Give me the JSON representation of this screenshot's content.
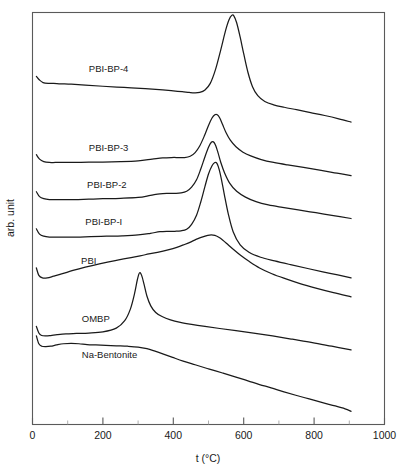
{
  "chart_data": {
    "type": "line",
    "title": "",
    "subtitle": "",
    "xlabel": "t (°C)",
    "ylabel": "arb. unit",
    "xlim": [
      0,
      1000
    ],
    "ylim": [
      0,
      1
    ],
    "grid": false,
    "legend_position": "inline-curve-labels",
    "x_major_ticks": [
      0,
      200,
      400,
      600,
      800,
      1000
    ],
    "x_minor_ticks": [
      100,
      300,
      500,
      700,
      900
    ],
    "x_tick_labels": [
      "0",
      "200",
      "400",
      "600",
      "800",
      "1000"
    ],
    "y_tick_labels": [],
    "y_axis_note": "arbitrary units, curves vertically offset",
    "series": [
      {
        "name": "PBI-BP-4",
        "label_x": 160,
        "peak_temperature": 570,
        "peak_note": "large sharp exothermic peak",
        "x": [
          11,
          20,
          30,
          45,
          60,
          80,
          110,
          150,
          200,
          260,
          320,
          370,
          400,
          425,
          445,
          460,
          475,
          490,
          505,
          520,
          535,
          548,
          558,
          566,
          572,
          580,
          590,
          600,
          612,
          625,
          640,
          660,
          685,
          715,
          750,
          790,
          830,
          870,
          905
        ],
        "y": [
          0.845,
          0.836,
          0.83,
          0.828,
          0.828,
          0.827,
          0.826,
          0.824,
          0.821,
          0.818,
          0.815,
          0.812,
          0.81,
          0.808,
          0.806,
          0.805,
          0.806,
          0.812,
          0.828,
          0.862,
          0.91,
          0.955,
          0.982,
          0.993,
          0.992,
          0.975,
          0.94,
          0.9,
          0.855,
          0.82,
          0.798,
          0.784,
          0.776,
          0.77,
          0.764,
          0.757,
          0.75,
          0.742,
          0.734
        ]
      },
      {
        "name": "PBI-BP-3",
        "label_x": 160,
        "peak_temperature": 520,
        "peak_note": "medium sharp peak",
        "x": [
          11,
          20,
          32,
          48,
          65,
          90,
          120,
          160,
          200,
          250,
          300,
          340,
          370,
          395,
          415,
          432,
          448,
          462,
          475,
          488,
          500,
          510,
          518,
          525,
          532,
          540,
          550,
          562,
          578,
          598,
          620,
          650,
          685,
          725,
          770,
          820,
          865,
          905
        ],
        "y": [
          0.655,
          0.644,
          0.638,
          0.636,
          0.636,
          0.636,
          0.636,
          0.637,
          0.637,
          0.638,
          0.64,
          0.644,
          0.647,
          0.648,
          0.648,
          0.648,
          0.651,
          0.66,
          0.676,
          0.7,
          0.726,
          0.744,
          0.752,
          0.752,
          0.744,
          0.728,
          0.708,
          0.69,
          0.674,
          0.661,
          0.652,
          0.643,
          0.636,
          0.63,
          0.624,
          0.617,
          0.61,
          0.604
        ]
      },
      {
        "name": "PBI-BP-2",
        "label_x": 155,
        "peak_temperature": 515,
        "peak_note": "medium sharp peak",
        "x": [
          11,
          20,
          32,
          48,
          65,
          90,
          120,
          160,
          200,
          250,
          300,
          335,
          362,
          385,
          405,
          422,
          438,
          452,
          466,
          478,
          490,
          500,
          508,
          514,
          520,
          527,
          535,
          546,
          560,
          580,
          605,
          635,
          670,
          710,
          755,
          805,
          855,
          905
        ],
        "y": [
          0.565,
          0.553,
          0.548,
          0.546,
          0.546,
          0.546,
          0.546,
          0.547,
          0.548,
          0.549,
          0.551,
          0.556,
          0.56,
          0.561,
          0.561,
          0.562,
          0.566,
          0.576,
          0.594,
          0.62,
          0.65,
          0.673,
          0.685,
          0.686,
          0.678,
          0.66,
          0.636,
          0.61,
          0.586,
          0.566,
          0.552,
          0.541,
          0.533,
          0.527,
          0.521,
          0.514,
          0.507,
          0.5
        ]
      },
      {
        "name": "PBI-BP-I",
        "label_x": 150,
        "peak_temperature": 520,
        "peak_note": "sharp peak with steep fall",
        "x": [
          11,
          20,
          32,
          48,
          65,
          90,
          125,
          165,
          210,
          255,
          300,
          335,
          362,
          385,
          405,
          422,
          438,
          452,
          466,
          478,
          490,
          500,
          510,
          518,
          524,
          530,
          537,
          545,
          556,
          570,
          590,
          615,
          648,
          688,
          733,
          785,
          845,
          905
        ],
        "y": [
          0.475,
          0.462,
          0.457,
          0.455,
          0.455,
          0.455,
          0.455,
          0.456,
          0.457,
          0.458,
          0.46,
          0.464,
          0.468,
          0.469,
          0.469,
          0.47,
          0.474,
          0.486,
          0.508,
          0.54,
          0.578,
          0.608,
          0.628,
          0.636,
          0.634,
          0.62,
          0.594,
          0.558,
          0.512,
          0.468,
          0.436,
          0.418,
          0.406,
          0.397,
          0.388,
          0.378,
          0.367,
          0.356
        ]
      },
      {
        "name": "PBI",
        "label_x": 138,
        "peak_temperature": 505,
        "peak_note": "broad shallow peak",
        "x": [
          11,
          18,
          28,
          42,
          60,
          85,
          115,
          150,
          190,
          235,
          280,
          320,
          355,
          385,
          410,
          432,
          452,
          470,
          486,
          498,
          508,
          518,
          528,
          540,
          555,
          572,
          592,
          615,
          645,
          680,
          718,
          760,
          805,
          855,
          905
        ],
        "y": [
          0.38,
          0.362,
          0.356,
          0.356,
          0.36,
          0.366,
          0.374,
          0.382,
          0.39,
          0.398,
          0.405,
          0.412,
          0.418,
          0.424,
          0.43,
          0.437,
          0.444,
          0.451,
          0.456,
          0.459,
          0.46,
          0.459,
          0.455,
          0.448,
          0.437,
          0.424,
          0.41,
          0.396,
          0.38,
          0.366,
          0.354,
          0.342,
          0.331,
          0.32,
          0.31
        ]
      },
      {
        "name": "OMBP",
        "label_x": 140,
        "peak_temperature": 305,
        "peak_note": "very sharp narrow peak",
        "x": [
          11,
          18,
          26,
          38,
          52,
          70,
          95,
          125,
          160,
          200,
          238,
          262,
          278,
          290,
          298,
          304,
          310,
          317,
          325,
          336,
          350,
          368,
          392,
          420,
          452,
          490,
          532,
          578,
          628,
          682,
          738,
          795,
          850,
          905
        ],
        "y": [
          0.238,
          0.222,
          0.216,
          0.215,
          0.216,
          0.218,
          0.22,
          0.221,
          0.222,
          0.225,
          0.234,
          0.252,
          0.28,
          0.318,
          0.352,
          0.368,
          0.362,
          0.34,
          0.312,
          0.288,
          0.272,
          0.262,
          0.254,
          0.248,
          0.243,
          0.238,
          0.233,
          0.228,
          0.222,
          0.215,
          0.207,
          0.199,
          0.19,
          0.181
        ]
      },
      {
        "name": "Na-Bentonite",
        "label_x": 140,
        "peak_temperature": null,
        "peak_note": "broad endothermic baseline with steady decline",
        "x": [
          11,
          18,
          26,
          38,
          52,
          68,
          88,
          110,
          132,
          155,
          180,
          208,
          238,
          270,
          300,
          325,
          348,
          372,
          398,
          428,
          462,
          500,
          540,
          578,
          612,
          645,
          678,
          712,
          748,
          786,
          824,
          860,
          888,
          905
        ],
        "y": [
          0.215,
          0.196,
          0.19,
          0.189,
          0.19,
          0.193,
          0.196,
          0.197,
          0.196,
          0.194,
          0.193,
          0.192,
          0.191,
          0.19,
          0.188,
          0.184,
          0.178,
          0.171,
          0.163,
          0.154,
          0.145,
          0.135,
          0.125,
          0.115,
          0.106,
          0.097,
          0.089,
          0.08,
          0.071,
          0.062,
          0.053,
          0.045,
          0.038,
          0.032
        ]
      }
    ]
  }
}
